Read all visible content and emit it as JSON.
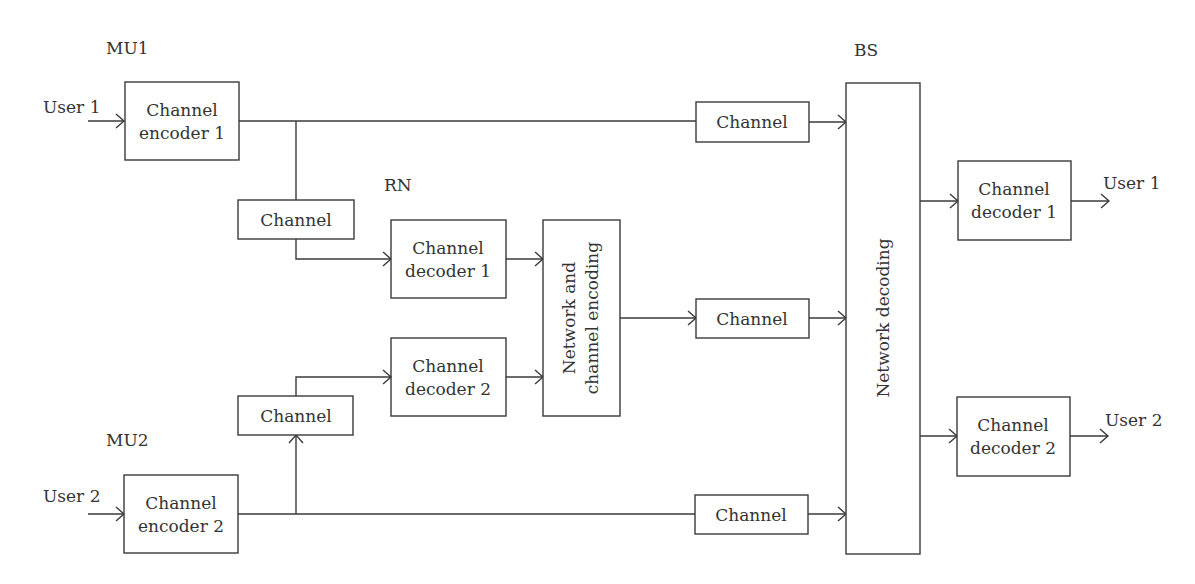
{
  "diagram": {
    "sections": {
      "mu1": "MU1",
      "mu2": "MU2",
      "rn": "RN",
      "bs": "BS"
    },
    "inputs": {
      "user1": "User 1",
      "user2": "User 2"
    },
    "outputs": {
      "user1": "User 1",
      "user2": "User 2"
    },
    "blocks": {
      "encoder1": {
        "line1": "Channel",
        "line2": "encoder 1"
      },
      "encoder2": {
        "line1": "Channel",
        "line2": "encoder 2"
      },
      "channel_mu1_rn": "Channel",
      "channel_mu2_rn": "Channel",
      "rn_decoder1": {
        "line1": "Channel",
        "line2": "decoder 1"
      },
      "rn_decoder2": {
        "line1": "Channel",
        "line2": "decoder 2"
      },
      "rn_network": {
        "line1": "Network and",
        "line2": "channel encoding"
      },
      "channel_mu1_bs": "Channel",
      "channel_rn_bs": "Channel",
      "channel_mu2_bs": "Channel",
      "bs_network": "Network decoding",
      "bs_decoder1": {
        "line1": "Channel",
        "line2": "decoder 1"
      },
      "bs_decoder2": {
        "line1": "Channel",
        "line2": "decoder 2"
      }
    },
    "colors": {
      "stroke": "#3a3a3a",
      "text": "#333333",
      "background": "#ffffff"
    }
  }
}
